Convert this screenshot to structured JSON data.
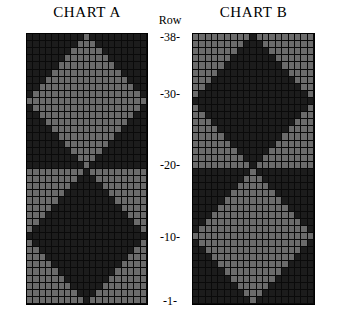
{
  "charts": {
    "a": {
      "title": "CHART A",
      "columns": 19,
      "rows": 38
    },
    "b": {
      "title": "CHART B",
      "columns": 19,
      "rows": 38
    }
  },
  "axis": {
    "heading": "Row",
    "ticks": [
      {
        "label": "-38-",
        "row": 38
      },
      {
        "label": "-30-",
        "row": 30
      },
      {
        "label": "-20-",
        "row": 20
      },
      {
        "label": "-10-",
        "row": 10
      },
      {
        "label": "-1-",
        "row": 1
      }
    ]
  },
  "colors": {
    "light": "#6b6b6b",
    "dark": "#1c1c1c",
    "gridline": "#000000",
    "background": "#ffffff"
  },
  "chart_data": {
    "type": "heatmap",
    "xlabel": "Stitch",
    "ylabel": "Row",
    "legend": [
      "light",
      "dark"
    ],
    "grid": true,
    "columns": 19,
    "rows": 38,
    "row_tick_labels": [
      "-38-",
      "-30-",
      "-20-",
      "-10-",
      "-1-"
    ],
    "series": [
      {
        "name": "CHART A",
        "encoding": {
          "0": "dark",
          "1": "light"
        },
        "note": "Rows listed top (row 38) to bottom (row 1). Upper block rows 38-20 use a light diamond on dark ground; lower block rows 19-1 invert to a dark diamond on light ground."
      },
      {
        "name": "CHART B",
        "encoding": {
          "0": "dark",
          "1": "light"
        },
        "note": "Pixelwise inversion of CHART A."
      }
    ]
  }
}
